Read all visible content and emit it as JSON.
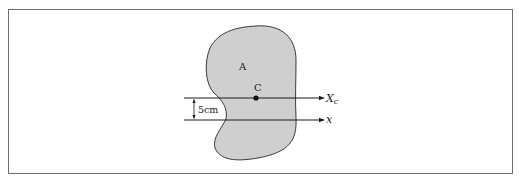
{
  "figure": {
    "region_label": "A",
    "centroid_label": "C",
    "centroidal_axis_label": "X",
    "centroidal_axis_subscript": "c",
    "parallel_axis_label": "x",
    "distance_label": "5cm"
  },
  "colors": {
    "region_fill": "#cfcfcf",
    "outline": "#3a3a3a",
    "axis": "#1a1a1a",
    "frame": "#6e6e6e"
  }
}
